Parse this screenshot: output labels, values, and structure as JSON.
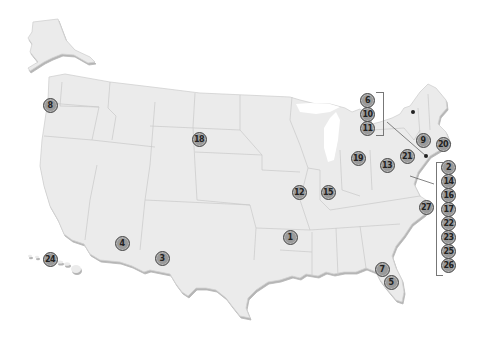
{
  "map": {
    "title": "United States locations map",
    "colors": {
      "land": "#ebebeb",
      "border": "#c4c4c4",
      "shadow": "#bdbdbd",
      "marker_fill": "#9a9a9a",
      "marker_ring": "#4a4a4a"
    },
    "markers": [
      {
        "id": "1",
        "label": "1",
        "x": 290,
        "y": 237
      },
      {
        "id": "3",
        "label": "3",
        "x": 162,
        "y": 258
      },
      {
        "id": "4",
        "label": "4",
        "x": 122,
        "y": 243
      },
      {
        "id": "5",
        "label": "5",
        "x": 391,
        "y": 282
      },
      {
        "id": "7",
        "label": "7",
        "x": 382,
        "y": 269
      },
      {
        "id": "8",
        "label": "8",
        "x": 50,
        "y": 105
      },
      {
        "id": "9",
        "label": "9",
        "x": 423,
        "y": 140
      },
      {
        "id": "12",
        "label": "12",
        "x": 299,
        "y": 192
      },
      {
        "id": "13",
        "label": "13",
        "x": 387,
        "y": 165
      },
      {
        "id": "15",
        "label": "15",
        "x": 328,
        "y": 192
      },
      {
        "id": "18",
        "label": "18",
        "x": 199,
        "y": 139
      },
      {
        "id": "19",
        "label": "19",
        "x": 358,
        "y": 158
      },
      {
        "id": "20",
        "label": "20",
        "x": 443,
        "y": 144
      },
      {
        "id": "21",
        "label": "21",
        "x": 407,
        "y": 156
      },
      {
        "id": "24",
        "label": "24",
        "x": 50,
        "y": 259
      },
      {
        "id": "27",
        "label": "27",
        "x": 426,
        "y": 207
      }
    ],
    "ne_stack": [
      {
        "id": "6",
        "label": "6"
      },
      {
        "id": "10",
        "label": "10"
      },
      {
        "id": "11",
        "label": "11"
      }
    ],
    "east_stack": [
      {
        "id": "2",
        "label": "2"
      },
      {
        "id": "14",
        "label": "14"
      },
      {
        "id": "16",
        "label": "16"
      },
      {
        "id": "17",
        "label": "17"
      },
      {
        "id": "22",
        "label": "22"
      },
      {
        "id": "23",
        "label": "23"
      },
      {
        "id": "25",
        "label": "25"
      },
      {
        "id": "26",
        "label": "26"
      }
    ]
  }
}
